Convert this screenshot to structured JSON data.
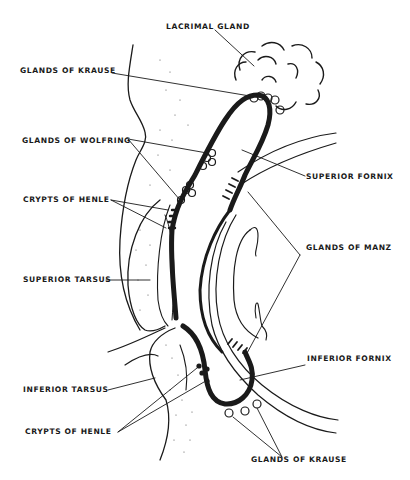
{
  "figure": {
    "ink_color": "#1a1a1a",
    "background": "#ffffff"
  },
  "labels": {
    "lacrimal_gland": "LACRIMAL GLAND",
    "glands_of_krause_upper": "GLANDS OF KRAUSE",
    "glands_of_wolfring": "GLANDS OF WOLFRING",
    "crypts_of_henle_upper": "CRYPTS OF HENLE",
    "superior_tarsus": "SUPERIOR TARSUS",
    "superior_fornix": "SUPERIOR FORNIX",
    "glands_of_manz": "GLANDS OF MANZ",
    "inferior_fornix": "INFERIOR FORNIX",
    "inferior_tarsus": "INFERIOR TARSUS",
    "crypts_of_henle_lower": "CRYPTS OF HENLE",
    "glands_of_krause_lower": "GLANDS OF KRAUSE"
  }
}
